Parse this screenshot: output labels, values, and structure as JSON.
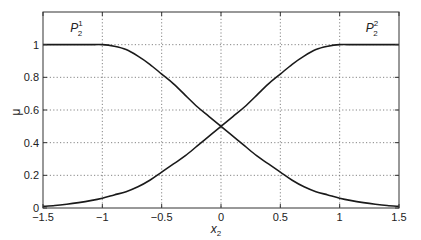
{
  "chart_data": {
    "type": "line",
    "title": "",
    "xlabel": "x_2",
    "ylabel": "μ",
    "xlim": [
      -1.5,
      1.5
    ],
    "ylim": [
      0,
      1.2
    ],
    "xticks": [
      -1.5,
      -1,
      -0.5,
      0,
      0.5,
      1,
      1.5
    ],
    "xtick_labels": [
      "−1.5",
      "−1",
      "−0.5",
      "0",
      "0.5",
      "1",
      "1.5"
    ],
    "yticks": [
      0,
      0.2,
      0.4,
      0.6,
      0.8,
      1
    ],
    "ytick_labels": [
      "0",
      "0.2",
      "0.4",
      "0.6",
      "0.8",
      "1"
    ],
    "grid": true,
    "grid_style": "dotted",
    "legend": null,
    "x": [
      -1.5,
      -1.4,
      -1.3,
      -1.2,
      -1.1,
      -1.0,
      -0.9,
      -0.8,
      -0.7,
      -0.6,
      -0.5,
      -0.4,
      -0.3,
      -0.2,
      -0.1,
      0.0,
      0.1,
      0.2,
      0.3,
      0.4,
      0.5,
      0.6,
      0.7,
      0.8,
      0.9,
      1.0,
      1.1,
      1.2,
      1.3,
      1.4,
      1.5
    ],
    "series": [
      {
        "name": "P_2^1",
        "values": [
          1.0,
          1.0,
          1.0,
          1.0,
          1.0,
          1.0,
          0.99,
          0.97,
          0.93,
          0.88,
          0.82,
          0.76,
          0.69,
          0.62,
          0.56,
          0.5,
          0.44,
          0.38,
          0.32,
          0.27,
          0.22,
          0.17,
          0.13,
          0.1,
          0.08,
          0.06,
          0.045,
          0.033,
          0.023,
          0.015,
          0.01
        ]
      },
      {
        "name": "P_2^2",
        "values": [
          0.01,
          0.015,
          0.023,
          0.033,
          0.045,
          0.06,
          0.08,
          0.1,
          0.13,
          0.17,
          0.22,
          0.27,
          0.32,
          0.38,
          0.44,
          0.5,
          0.56,
          0.62,
          0.69,
          0.76,
          0.82,
          0.88,
          0.93,
          0.97,
          0.99,
          1.0,
          1.0,
          1.0,
          1.0,
          1.0,
          1.0
        ]
      }
    ],
    "annotations": [
      {
        "text": "P",
        "sub": "2",
        "sup": "1",
        "x": -1.27,
        "y": 1.08
      },
      {
        "text": "P",
        "sub": "2",
        "sup": "2",
        "x": 1.22,
        "y": 1.08
      }
    ]
  },
  "labels": {
    "xlabel_main": "x",
    "xlabel_sub": "2",
    "ylabel": "μ"
  }
}
